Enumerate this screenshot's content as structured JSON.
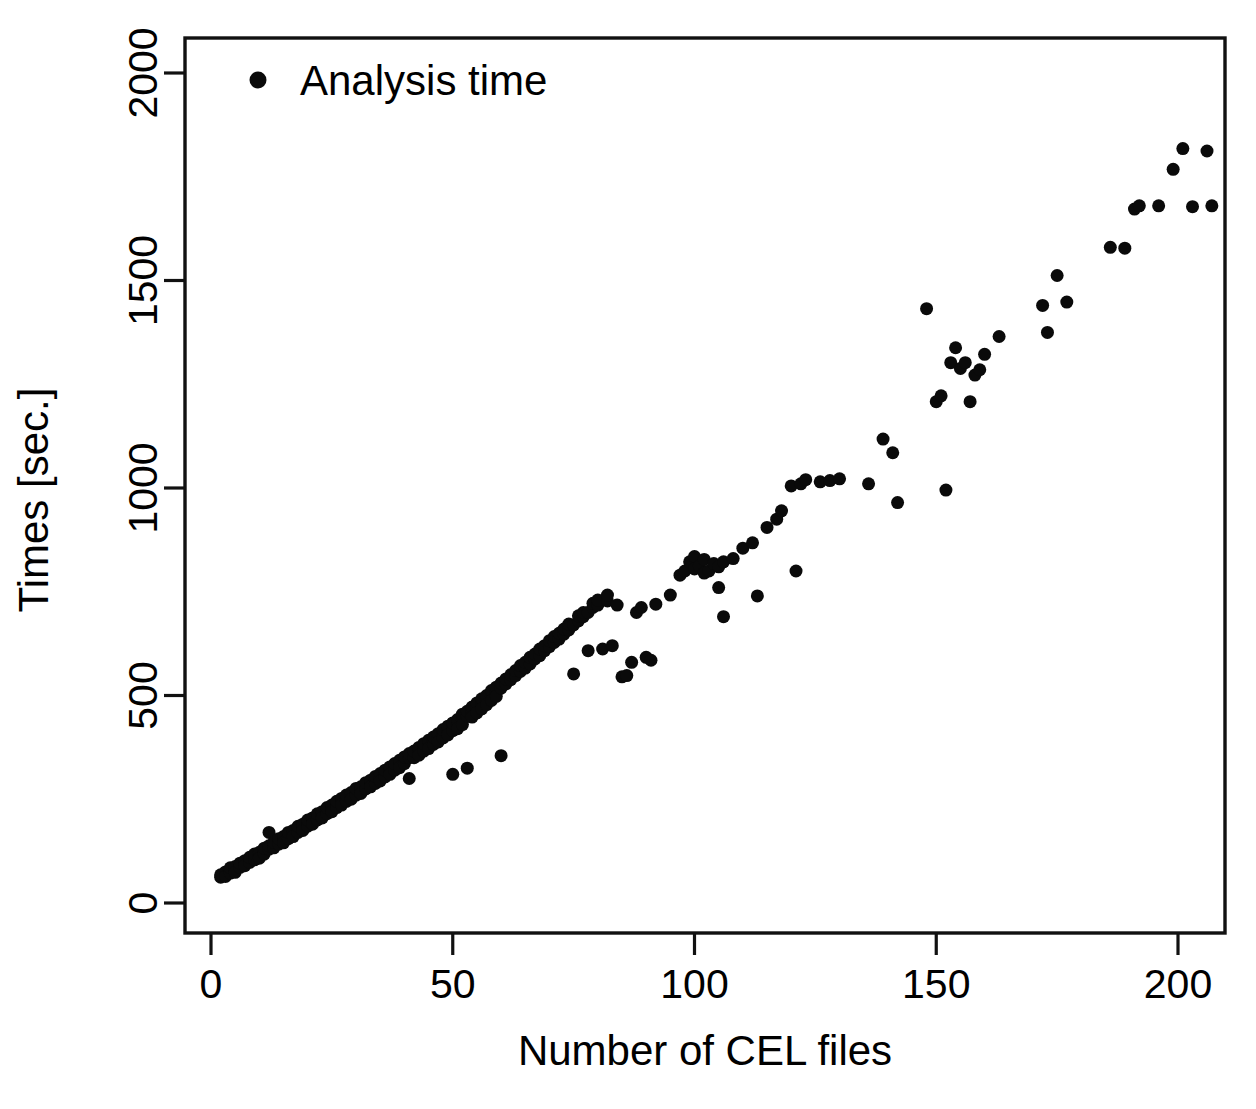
{
  "chart_data": {
    "type": "scatter",
    "title": "",
    "xlabel": "Number of CEL files",
    "ylabel": "Times [sec.]",
    "xlim": [
      -3,
      212
    ],
    "ylim": [
      -60,
      2075
    ],
    "grid": false,
    "xticks": [
      0,
      50,
      100,
      150,
      200
    ],
    "xtick_labels": [
      "0",
      "50",
      "100",
      "150",
      "200"
    ],
    "yticks": [
      0,
      500,
      1000,
      1500,
      2000
    ],
    "ytick_labels": [
      "0",
      "500",
      "1000",
      "1500",
      "2000"
    ],
    "legend": {
      "position": "top-left-inside",
      "entries": [
        {
          "label": "Analysis time",
          "marker": "filled-circle",
          "color": "#0a0a0a"
        }
      ]
    },
    "marker": {
      "shape": "filled-circle",
      "size_px": 13,
      "color": "#0a0a0a"
    },
    "series": [
      {
        "name": "Analysis time",
        "color": "#0a0a0a",
        "points": [
          [
            2,
            62
          ],
          [
            2,
            68
          ],
          [
            3,
            70
          ],
          [
            3,
            75
          ],
          [
            3,
            64
          ],
          [
            4,
            78
          ],
          [
            4,
            72
          ],
          [
            4,
            85
          ],
          [
            5,
            80
          ],
          [
            5,
            88
          ],
          [
            5,
            74
          ],
          [
            6,
            92
          ],
          [
            6,
            86
          ],
          [
            6,
            96
          ],
          [
            7,
            95
          ],
          [
            7,
            102
          ],
          [
            7,
            90
          ],
          [
            8,
            105
          ],
          [
            8,
            98
          ],
          [
            8,
            110
          ],
          [
            9,
            112
          ],
          [
            9,
            104
          ],
          [
            9,
            118
          ],
          [
            10,
            115
          ],
          [
            10,
            122
          ],
          [
            10,
            108
          ],
          [
            11,
            126
          ],
          [
            11,
            118
          ],
          [
            11,
            132
          ],
          [
            12,
            130
          ],
          [
            12,
            138
          ],
          [
            12,
            170
          ],
          [
            13,
            140
          ],
          [
            13,
            133
          ],
          [
            13,
            146
          ],
          [
            14,
            148
          ],
          [
            14,
            142
          ],
          [
            14,
            155
          ],
          [
            15,
            152
          ],
          [
            15,
            160
          ],
          [
            15,
            145
          ],
          [
            16,
            162
          ],
          [
            16,
            155
          ],
          [
            16,
            170
          ],
          [
            17,
            168
          ],
          [
            17,
            175
          ],
          [
            17,
            160
          ],
          [
            18,
            178
          ],
          [
            18,
            170
          ],
          [
            18,
            185
          ],
          [
            19,
            182
          ],
          [
            19,
            190
          ],
          [
            19,
            175
          ],
          [
            20,
            192
          ],
          [
            20,
            185
          ],
          [
            20,
            200
          ],
          [
            21,
            198
          ],
          [
            21,
            205
          ],
          [
            21,
            190
          ],
          [
            22,
            208
          ],
          [
            22,
            200
          ],
          [
            22,
            215
          ],
          [
            23,
            212
          ],
          [
            23,
            220
          ],
          [
            23,
            205
          ],
          [
            24,
            222
          ],
          [
            24,
            215
          ],
          [
            24,
            230
          ],
          [
            25,
            228
          ],
          [
            25,
            236
          ],
          [
            25,
            220
          ],
          [
            26,
            238
          ],
          [
            26,
            230
          ],
          [
            26,
            245
          ],
          [
            27,
            244
          ],
          [
            27,
            252
          ],
          [
            27,
            236
          ],
          [
            28,
            252
          ],
          [
            28,
            245
          ],
          [
            28,
            260
          ],
          [
            29,
            258
          ],
          [
            29,
            266
          ],
          [
            29,
            250
          ],
          [
            30,
            268
          ],
          [
            30,
            260
          ],
          [
            30,
            276
          ],
          [
            31,
            272
          ],
          [
            31,
            280
          ],
          [
            31,
            264
          ],
          [
            32,
            282
          ],
          [
            32,
            275
          ],
          [
            32,
            290
          ],
          [
            33,
            288
          ],
          [
            33,
            296
          ],
          [
            33,
            280
          ],
          [
            34,
            296
          ],
          [
            34,
            288
          ],
          [
            34,
            305
          ],
          [
            35,
            302
          ],
          [
            35,
            312
          ],
          [
            35,
            294
          ],
          [
            36,
            312
          ],
          [
            36,
            304
          ],
          [
            36,
            320
          ],
          [
            37,
            318
          ],
          [
            37,
            328
          ],
          [
            37,
            310
          ],
          [
            38,
            328
          ],
          [
            38,
            320
          ],
          [
            38,
            336
          ],
          [
            39,
            334
          ],
          [
            39,
            344
          ],
          [
            39,
            326
          ],
          [
            40,
            344
          ],
          [
            40,
            336
          ],
          [
            40,
            352
          ],
          [
            41,
            350
          ],
          [
            41,
            360
          ],
          [
            41,
            300
          ],
          [
            42,
            358
          ],
          [
            42,
            350
          ],
          [
            42,
            366
          ],
          [
            43,
            366
          ],
          [
            43,
            375
          ],
          [
            43,
            356
          ],
          [
            44,
            374
          ],
          [
            44,
            366
          ],
          [
            44,
            384
          ],
          [
            45,
            382
          ],
          [
            45,
            392
          ],
          [
            45,
            372
          ],
          [
            46,
            390
          ],
          [
            46,
            382
          ],
          [
            46,
            400
          ],
          [
            47,
            398
          ],
          [
            47,
            408
          ],
          [
            47,
            388
          ],
          [
            48,
            406
          ],
          [
            48,
            398
          ],
          [
            48,
            418
          ],
          [
            49,
            416
          ],
          [
            49,
            426
          ],
          [
            49,
            405
          ],
          [
            50,
            424
          ],
          [
            50,
            415
          ],
          [
            50,
            434
          ],
          [
            50,
            310
          ],
          [
            51,
            432
          ],
          [
            51,
            442
          ],
          [
            51,
            420
          ],
          [
            52,
            440
          ],
          [
            52,
            455
          ],
          [
            52,
            430
          ],
          [
            53,
            450
          ],
          [
            53,
            462
          ],
          [
            53,
            325
          ],
          [
            54,
            460
          ],
          [
            54,
            472
          ],
          [
            54,
            448
          ],
          [
            55,
            470
          ],
          [
            55,
            482
          ],
          [
            55,
            458
          ],
          [
            56,
            480
          ],
          [
            56,
            492
          ],
          [
            56,
            468
          ],
          [
            57,
            490
          ],
          [
            57,
            500
          ],
          [
            57,
            478
          ],
          [
            58,
            498
          ],
          [
            58,
            512
          ],
          [
            58,
            488
          ],
          [
            59,
            508
          ],
          [
            59,
            520
          ],
          [
            59,
            498
          ],
          [
            60,
            518
          ],
          [
            60,
            530
          ],
          [
            60,
            355
          ],
          [
            61,
            528
          ],
          [
            61,
            540
          ],
          [
            62,
            538
          ],
          [
            62,
            550
          ],
          [
            63,
            548
          ],
          [
            63,
            560
          ],
          [
            64,
            558
          ],
          [
            64,
            572
          ],
          [
            65,
            566
          ],
          [
            65,
            580
          ],
          [
            66,
            576
          ],
          [
            66,
            592
          ],
          [
            67,
            588
          ],
          [
            67,
            600
          ],
          [
            68,
            596
          ],
          [
            68,
            612
          ],
          [
            69,
            608
          ],
          [
            69,
            620
          ],
          [
            70,
            618
          ],
          [
            70,
            632
          ],
          [
            71,
            628
          ],
          [
            71,
            642
          ],
          [
            72,
            636
          ],
          [
            72,
            650
          ],
          [
            73,
            648
          ],
          [
            73,
            660
          ],
          [
            74,
            658
          ],
          [
            74,
            672
          ],
          [
            75,
            670
          ],
          [
            75,
            552
          ],
          [
            76,
            680
          ],
          [
            76,
            692
          ],
          [
            77,
            690
          ],
          [
            77,
            700
          ],
          [
            78,
            700
          ],
          [
            78,
            608
          ],
          [
            79,
            712
          ],
          [
            79,
            722
          ],
          [
            80,
            718
          ],
          [
            80,
            730
          ],
          [
            81,
            612
          ],
          [
            82,
            728
          ],
          [
            82,
            742
          ],
          [
            83,
            620
          ],
          [
            84,
            718
          ],
          [
            85,
            545
          ],
          [
            86,
            548
          ],
          [
            87,
            580
          ],
          [
            88,
            700
          ],
          [
            89,
            712
          ],
          [
            90,
            592
          ],
          [
            91,
            585
          ],
          [
            92,
            720
          ],
          [
            95,
            742
          ],
          [
            97,
            790
          ],
          [
            98,
            800
          ],
          [
            99,
            822
          ],
          [
            100,
            835
          ],
          [
            100,
            805
          ],
          [
            101,
            812
          ],
          [
            102,
            828
          ],
          [
            102,
            795
          ],
          [
            103,
            800
          ],
          [
            104,
            818
          ],
          [
            105,
            760
          ],
          [
            105,
            810
          ],
          [
            106,
            822
          ],
          [
            106,
            690
          ],
          [
            108,
            830
          ],
          [
            110,
            855
          ],
          [
            112,
            868
          ],
          [
            113,
            740
          ],
          [
            115,
            905
          ],
          [
            117,
            925
          ],
          [
            118,
            945
          ],
          [
            120,
            1005
          ],
          [
            121,
            800
          ],
          [
            122,
            1010
          ],
          [
            123,
            1020
          ],
          [
            126,
            1015
          ],
          [
            128,
            1018
          ],
          [
            130,
            1022
          ],
          [
            136,
            1010
          ],
          [
            139,
            1118
          ],
          [
            141,
            1085
          ],
          [
            142,
            965
          ],
          [
            148,
            1432
          ],
          [
            150,
            1208
          ],
          [
            151,
            1222
          ],
          [
            152,
            995
          ],
          [
            153,
            1302
          ],
          [
            154,
            1338
          ],
          [
            155,
            1288
          ],
          [
            156,
            1302
          ],
          [
            157,
            1208
          ],
          [
            158,
            1272
          ],
          [
            159,
            1285
          ],
          [
            160,
            1322
          ],
          [
            163,
            1365
          ],
          [
            172,
            1440
          ],
          [
            173,
            1375
          ],
          [
            175,
            1512
          ],
          [
            177,
            1448
          ],
          [
            186,
            1580
          ],
          [
            189,
            1578
          ],
          [
            191,
            1672
          ],
          [
            192,
            1680
          ],
          [
            196,
            1680
          ],
          [
            199,
            1768
          ],
          [
            201,
            1818
          ],
          [
            203,
            1678
          ],
          [
            206,
            1812
          ],
          [
            207,
            1680
          ]
        ]
      }
    ]
  }
}
